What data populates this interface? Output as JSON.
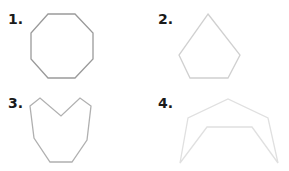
{
  "figures": [
    {
      "label": "1.",
      "shape": "octagon",
      "stroke": "#9a9a9a",
      "points": "48,14 75,14 93,33 93,59 75,78 48,78 31,59 31,33"
    },
    {
      "label": "2.",
      "shape": "pentagon",
      "stroke": "#d0d0d0",
      "points": "208,14 240,55 228,78 190,78 179,55"
    },
    {
      "label": "3.",
      "shape": "heart-like polygon",
      "stroke": "#b0b0b0",
      "points": "30,106 40,98 61,116 80,98 91,106 87,140 72,162 50,162 34,138"
    },
    {
      "label": "4.",
      "shape": "arch polygon",
      "stroke": "#e0e0e0",
      "points": "180,163 188,118 228,99 268,118 278,163 252,127 207,127"
    }
  ]
}
